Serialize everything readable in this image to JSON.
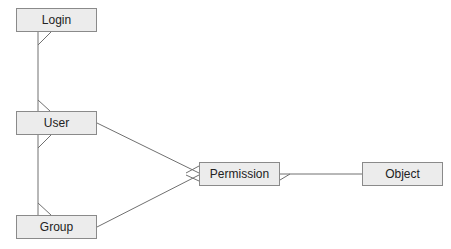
{
  "diagram": {
    "type": "entity-relationship",
    "entities": [
      {
        "id": "login",
        "label": "Login",
        "x": 16,
        "y": 8
      },
      {
        "id": "user",
        "label": "User",
        "x": 16,
        "y": 111
      },
      {
        "id": "group",
        "label": "Group",
        "x": 16,
        "y": 215
      },
      {
        "id": "permission",
        "label": "Permission",
        "x": 199,
        "y": 162
      },
      {
        "id": "object",
        "label": "Object",
        "x": 362,
        "y": 162
      }
    ],
    "relationships": [
      {
        "from": "login",
        "to": "user",
        "from_end": "one",
        "to_end": "many"
      },
      {
        "from": "user",
        "to": "group",
        "from_end": "one",
        "to_end": "many"
      },
      {
        "from": "user",
        "to": "permission",
        "from_end": "one",
        "to_end": "many"
      },
      {
        "from": "group",
        "to": "permission",
        "from_end": "one",
        "to_end": "many"
      },
      {
        "from": "permission",
        "to": "object",
        "from_end": "many",
        "to_end": "one"
      }
    ],
    "colors": {
      "box_fill": "#ececec",
      "box_border": "#8a8a8a",
      "line": "#707070"
    }
  }
}
